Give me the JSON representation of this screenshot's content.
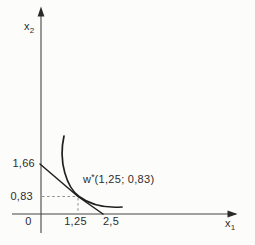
{
  "figure": {
    "background_color": "#fcfcfa",
    "ink_color": "#1f1f1f",
    "axis_color": "#454545",
    "dash_color": "#8c8c8c",
    "axis_labels": {
      "y": {
        "base": "x",
        "sub": "2"
      },
      "x": {
        "base": "x",
        "sub": "1"
      }
    },
    "y_tick_labels": {
      "upper": "1,66",
      "lower": "0,83"
    },
    "x_tick_labels": {
      "first": "1,25",
      "second": "2,5"
    },
    "origin_label": "0",
    "optimum_label": {
      "base": "w",
      "sup": "*",
      "rest": "(1,25; 0,83)"
    },
    "geometry": {
      "y_axis_path": "M 41 12 L 41 233",
      "x_axis_path": "M 12 214 L 236 214",
      "y_arrow_points": "41,6.5 37.6,16.5 44.4,16.5",
      "x_arrow_points": "237.5,214 227.5,210.6 227.5,217.4",
      "budget_line_path": "M 40 164 L 78 196.5 L 103 214",
      "indifference_curve_path": "M 64 136 C 58 162 67 187.5 79 196.5 C 91 205.5 108 208 122 207",
      "dash_horizontal_path": "M 42 196.5 L 77 196.5",
      "dash_vertical_path": "M 78 198 L 78 213"
    }
  },
  "chart_data": {
    "type": "line",
    "title": "",
    "xlabel": "x1",
    "ylabel": "x2",
    "xlim": [
      0,
      3.2
    ],
    "ylim": [
      0,
      3.4
    ],
    "grid": false,
    "legend": null,
    "x_ticks": [
      0,
      1.25,
      2.5
    ],
    "y_ticks": [
      0.83,
      1.66
    ],
    "series": [
      {
        "name": "budget line",
        "style": "straight",
        "points": [
          [
            0,
            1.66
          ],
          [
            2.5,
            0
          ]
        ]
      },
      {
        "name": "indifference curve",
        "style": "convex curve",
        "points": [
          [
            0.78,
            1.33
          ],
          [
            0.9,
            1.15
          ],
          [
            1.25,
            0.83
          ],
          [
            1.8,
            0.58
          ],
          [
            2.7,
            0.38
          ]
        ]
      }
    ],
    "annotations": [
      {
        "text": "w*(1,25; 0,83)",
        "meaning": "optimum / tangency point",
        "x": 1.25,
        "y": 0.83
      }
    ],
    "guides": [
      {
        "type": "dashed-horizontal",
        "from": [
          0,
          0.83
        ],
        "to": [
          1.25,
          0.83
        ]
      },
      {
        "type": "dashed-vertical",
        "from": [
          1.25,
          0
        ],
        "to": [
          1.25,
          0.83
        ]
      }
    ]
  }
}
